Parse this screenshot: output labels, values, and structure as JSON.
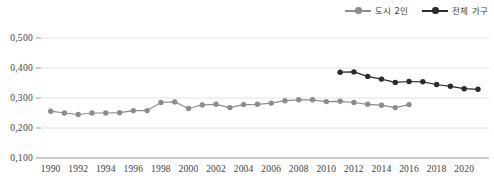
{
  "legend": {
    "position": "top-right",
    "entries": [
      {
        "label": "도시 2인",
        "color": "#8c8c8c",
        "name": "series-urban-two-person"
      },
      {
        "label": "전체 가구",
        "color": "#2b2b2b",
        "name": "series-all-households"
      }
    ]
  },
  "axes": {
    "y_ticks": [
      "0,500",
      "0,400",
      "0,300",
      "0,200",
      "0,100"
    ],
    "x_ticks": [
      "1990",
      "1992",
      "1994",
      "1996",
      "1998",
      "2000",
      "2002",
      "2004",
      "2006",
      "2008",
      "2010",
      "2012",
      "2014",
      "2016",
      "2018",
      "2020"
    ]
  },
  "chart_data": {
    "type": "line",
    "title": "",
    "xlabel": "",
    "ylabel": "",
    "ylim": [
      0.1,
      0.5
    ],
    "xlim": [
      1989.3,
      2021.8
    ],
    "ytick_step": 0.1,
    "grid": true,
    "legend_position": "top-right",
    "decimal_separator": ",",
    "x": [
      1990,
      1991,
      1992,
      1993,
      1994,
      1995,
      1996,
      1997,
      1998,
      1999,
      2000,
      2001,
      2002,
      2003,
      2004,
      2005,
      2006,
      2007,
      2008,
      2009,
      2010,
      2011,
      2012,
      2013,
      2014,
      2015,
      2016,
      2017,
      2018,
      2019,
      2020,
      2021
    ],
    "series": [
      {
        "name": "도시 2인",
        "color": "#8c8c8c",
        "x": [
          1990,
          1991,
          1992,
          1993,
          1994,
          1995,
          1996,
          1997,
          1998,
          1999,
          2000,
          2001,
          2002,
          2003,
          2004,
          2005,
          2006,
          2007,
          2008,
          2009,
          2010,
          2011,
          2012,
          2013,
          2014,
          2015,
          2016
        ],
        "values": [
          0.256,
          0.25,
          0.245,
          0.25,
          0.25,
          0.251,
          0.258,
          0.258,
          0.285,
          0.287,
          0.265,
          0.277,
          0.279,
          0.268,
          0.278,
          0.279,
          0.283,
          0.291,
          0.294,
          0.294,
          0.288,
          0.289,
          0.285,
          0.279,
          0.276,
          0.268,
          0.278
        ]
      },
      {
        "name": "전체 가구",
        "color": "#2b2b2b",
        "x": [
          2011,
          2012,
          2013,
          2014,
          2015,
          2016,
          2017,
          2018,
          2019,
          2020,
          2021
        ],
        "values": [
          0.386,
          0.387,
          0.372,
          0.363,
          0.352,
          0.355,
          0.354,
          0.345,
          0.339,
          0.331,
          0.329
        ]
      }
    ]
  }
}
